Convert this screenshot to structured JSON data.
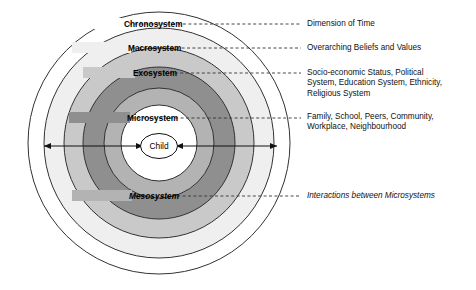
{
  "diagram": {
    "center": {
      "label": "Child",
      "fill": "#ffffff"
    },
    "rings": [
      {
        "key": "chronosystem",
        "label": "Chronosystem",
        "style": "bold",
        "fill": "#ffffff",
        "stroke": "#333333",
        "radius": 131,
        "label_x": 124,
        "label_y": 27,
        "leader_from_x": 129,
        "leader_to_x": 301,
        "leader_y": 24
      },
      {
        "key": "macrosystem",
        "label": "Macrosystem",
        "style": "bold",
        "fill": "#efefef",
        "stroke": "#333333",
        "radius": 115,
        "label_x": 128,
        "label_y": 51,
        "leader_from_x": 133,
        "leader_to_x": 301,
        "leader_y": 48
      },
      {
        "key": "exosystem",
        "label": "Exosystem",
        "style": "bold",
        "fill": "#c9c9c9",
        "stroke": "#333333",
        "radius": 95,
        "label_x": 133,
        "label_y": 76,
        "leader_from_x": 137,
        "leader_to_x": 301,
        "leader_y": 73
      },
      {
        "key": "microsystem",
        "label": "Microsystem",
        "style": "bold",
        "fill": "#8f8f8f",
        "stroke": "#333333",
        "radius": 76,
        "label_x": 127,
        "label_y": 121,
        "leader_from_x": 132,
        "leader_to_x": 301,
        "leader_y": 118
      },
      {
        "key": "mesosystem",
        "label": "Mesosystem",
        "style": "bold-italic",
        "fill": "#b3b3b3",
        "stroke": "#333333",
        "radius": 55,
        "label_x": 129,
        "label_y": 199,
        "leader_from_x": 134,
        "leader_to_x": 301,
        "leader_y": 196
      }
    ],
    "arrows": {
      "left_start_x": 44,
      "left_end_x": 143,
      "right_start_x": 176,
      "right_end_x": 277,
      "y": 146
    },
    "annotations": [
      {
        "key": "chronosystem-note",
        "text": "Dimension of Time",
        "style": "normal",
        "top": 19
      },
      {
        "key": "macrosystem-note",
        "text": "Overarching Beliefs and Values",
        "style": "normal",
        "top": 43
      },
      {
        "key": "exosystem-note",
        "text": "Socio-economic Status, Political\nSystem, Education System, Ethnicity,\nReligious System",
        "style": "normal",
        "top": 68
      },
      {
        "key": "microsystem-note",
        "text": "Family, School, Peers, Community,\nWorkplace, Neighbourhood",
        "style": "normal",
        "top": 112
      },
      {
        "key": "mesosystem-note",
        "text": "Interactions between Microsystems",
        "style": "italic",
        "top": 191
      }
    ]
  }
}
